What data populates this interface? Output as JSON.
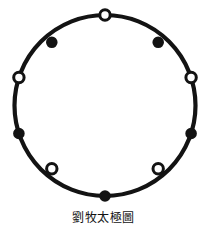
{
  "figure": {
    "title": "劉牧太極圖",
    "caption": "劉牧太極圖",
    "background_color": "#ffffff",
    "stroke_color": "#131313",
    "fill_marker_color": "#131313",
    "hollow_marker_fill": "#ffffff"
  },
  "chart_data": {
    "type": "scatter",
    "title": "劉牧太極圖",
    "subtitle": "",
    "xlabel": "",
    "ylabel": "",
    "grid": false,
    "legend_position": "none",
    "xlim": [
      0,
      207
    ],
    "ylim": [
      0,
      239
    ],
    "annotations": [
      "劉牧太極圖"
    ],
    "ring": {
      "center_x": 105,
      "center_y": 105.5,
      "radius": 90.5,
      "stroke_width": 4.2,
      "point_count": 10,
      "filled_count": 5,
      "hollow_count": 5,
      "angular_step_degrees": 36
    },
    "categories": [
      "top",
      "upper-right",
      "right",
      "lower-right",
      "bottom-right",
      "bottom",
      "bottom-left",
      "lower-left",
      "left",
      "upper-left"
    ],
    "series": [
      {
        "name": "markers",
        "values": [
          0,
          1,
          0,
          1,
          0,
          1,
          0,
          1,
          0,
          1
        ]
      }
    ],
    "points": [
      {
        "label": "top",
        "angle_deg": 90,
        "x": 105.0,
        "y": 15.0,
        "style": "hollow",
        "radius": 5.2
      },
      {
        "label": "upper-right",
        "angle_deg": 54,
        "x": 158.2,
        "y": 42.3,
        "style": "filled",
        "radius": 4.6
      },
      {
        "label": "right",
        "angle_deg": 18,
        "x": 191.1,
        "y": 77.5,
        "style": "hollow",
        "radius": 5.2
      },
      {
        "label": "lower-right",
        "angle_deg": -18,
        "x": 191.1,
        "y": 133.5,
        "style": "filled",
        "radius": 4.6
      },
      {
        "label": "bottom-right",
        "angle_deg": -54,
        "x": 158.2,
        "y": 168.7,
        "style": "hollow",
        "radius": 5.2
      },
      {
        "label": "bottom",
        "angle_deg": -90,
        "x": 105.0,
        "y": 196.0,
        "style": "filled",
        "radius": 4.6
      },
      {
        "label": "bottom-left",
        "angle_deg": 234,
        "x": 51.8,
        "y": 168.7,
        "style": "hollow",
        "radius": 5.2
      },
      {
        "label": "lower-left",
        "angle_deg": 198,
        "x": 18.9,
        "y": 133.5,
        "style": "filled",
        "radius": 4.6
      },
      {
        "label": "left",
        "angle_deg": 162,
        "x": 18.9,
        "y": 77.5,
        "style": "hollow",
        "radius": 5.2
      },
      {
        "label": "upper-left",
        "angle_deg": 126,
        "x": 51.8,
        "y": 42.3,
        "style": "filled",
        "radius": 4.6
      }
    ]
  }
}
